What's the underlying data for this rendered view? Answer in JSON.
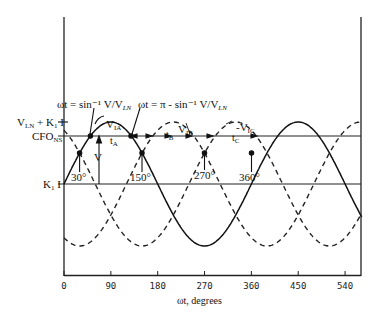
{
  "chart_data": {
    "type": "line",
    "title": "",
    "xlabel": "ωt, degrees",
    "ylabel": "",
    "xlim": [
      0,
      572
    ],
    "x_ticks": [
      0,
      90,
      180,
      270,
      360,
      450,
      540
    ],
    "x_tick_labels": [
      "0",
      "90",
      "180",
      "270",
      "360",
      "450",
      "540"
    ],
    "grid": false,
    "legend": null,
    "series": [
      {
        "name": "V_IA",
        "style": "solid",
        "phase_deg": 0,
        "formula": "K1I + V_LN*sin(ωt)"
      },
      {
        "name": "V_IB",
        "style": "dashed",
        "phase_deg": -120,
        "formula": "K1I + V_LN*sin(ωt-120°)"
      },
      {
        "name": "V_IC",
        "style": "dashed",
        "phase_deg": 120,
        "formula": "K1I + V_LN*sin(ωt+120°)"
      }
    ],
    "levels": [
      {
        "name": "V_LN + K1 I",
        "relative_value": 1.0
      },
      {
        "name": "CFO_NS",
        "relative_value": 0.774
      },
      {
        "name": "K1 I",
        "relative_value": 0.0
      }
    ],
    "annotations": [
      {
        "text": "ωt = sin⁻¹ V/V_LN",
        "at_deg": 50.7
      },
      {
        "text": "ωt = π − sin⁻¹ V/V_LN",
        "at_deg": 129.3
      },
      {
        "text": "30°",
        "at_deg": 30
      },
      {
        "text": "150°",
        "at_deg": 150
      },
      {
        "text": "270°",
        "at_deg": 270
      },
      {
        "text": "360°",
        "at_deg": 360
      },
      {
        "text": "t_A",
        "between_deg": [
          50.7,
          129.3
        ]
      },
      {
        "text": "t_B",
        "between_deg": [
          170.7,
          249.3
        ]
      },
      {
        "text": "t_C",
        "between_deg": [
          290.7,
          369.3
        ]
      },
      {
        "text": "V",
        "meaning": "distance from K1I to CFO_NS"
      }
    ]
  },
  "labels": {
    "y_top": "V",
    "y_top_sub": "LN",
    "y_top_rest": " + K",
    "y_top_sub2": "1",
    "y_top_end": " I",
    "cfo": "CFO",
    "cfo_sub": "NS",
    "k1i": "K",
    "k1i_sub": "1",
    "k1i_end": " I",
    "eq1": "ωt = sin⁻¹ V/V",
    "eq1_sub": "LN",
    "eq2": "ωt = π - sin⁻¹ V/V",
    "eq2_sub": "LN",
    "via": "V",
    "via_sub": "IA",
    "vib": "V",
    "vib_sub": "IB",
    "vic": "-V",
    "vic_sub": "IC",
    "ta": "t",
    "ta_sub": "A",
    "tb": "t",
    "tb_sub": "B",
    "tc": "t",
    "tc_sub": "C",
    "v": "V",
    "deg30": "30°",
    "deg150": "150°",
    "deg270": "270°",
    "deg360": "360°",
    "xlabel": "ωt, degrees",
    "ticks": [
      "0",
      "90",
      "180",
      "270",
      "360",
      "450",
      "540"
    ]
  }
}
